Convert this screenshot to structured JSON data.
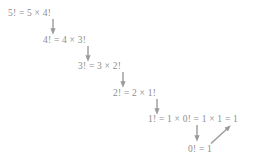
{
  "diagram": {
    "text_color": "#8d8d8d",
    "arrow_color": "#9a9a9a",
    "background": "#ffffff",
    "steps": [
      {
        "id": "step-5",
        "text": "5! = 5 × 4!",
        "x": 8,
        "y": 8
      },
      {
        "id": "step-4",
        "text": "4! = 4 × 3!",
        "x": 43,
        "y": 35
      },
      {
        "id": "step-3",
        "text": "3! = 3 × 2!",
        "x": 78,
        "y": 61
      },
      {
        "id": "step-2",
        "text": "2! = 2 × 1!",
        "x": 113,
        "y": 88
      },
      {
        "id": "step-1",
        "text": "1! = 1 × 0! = 1 × 1 = 1",
        "x": 148,
        "y": 114
      },
      {
        "id": "step-0",
        "text": "0! = 1",
        "x": 188,
        "y": 144
      }
    ],
    "arrows": [
      {
        "id": "arrow-5-to-4",
        "x1": 53,
        "y1": 19,
        "x2": 53,
        "y2": 33,
        "kind": "down"
      },
      {
        "id": "arrow-4-to-3",
        "x1": 88,
        "y1": 46,
        "x2": 88,
        "y2": 60,
        "kind": "down"
      },
      {
        "id": "arrow-3-to-2",
        "x1": 123,
        "y1": 72,
        "x2": 123,
        "y2": 86,
        "kind": "down"
      },
      {
        "id": "arrow-2-to-1",
        "x1": 157,
        "y1": 99,
        "x2": 157,
        "y2": 113,
        "kind": "down"
      },
      {
        "id": "arrow-1-to-0",
        "x1": 197,
        "y1": 125,
        "x2": 197,
        "y2": 140,
        "kind": "down"
      },
      {
        "id": "arrow-substitute-up",
        "x1": 211,
        "y1": 143,
        "x2": 230,
        "y2": 126,
        "kind": "diagonal-up-right"
      }
    ]
  }
}
